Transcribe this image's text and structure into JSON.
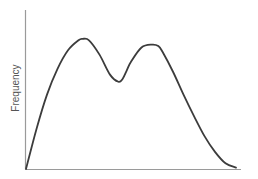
{
  "chart_data": {
    "type": "line",
    "title": "",
    "xlabel": "",
    "ylabel": "Frequency",
    "grid": false,
    "legend": "none",
    "x_ticks": [],
    "y_ticks": [],
    "xlim": [
      0,
      100
    ],
    "ylim": [
      0,
      100
    ],
    "series": [
      {
        "name": "distribution",
        "description": "bimodal distribution curve",
        "x": [
          0,
          5,
          10,
          15,
          20,
          25,
          27,
          30,
          35,
          40,
          44,
          46,
          48,
          50,
          55,
          60,
          63,
          65,
          70,
          75,
          80,
          85,
          90,
          95,
          100
        ],
        "y": [
          0,
          28,
          52,
          70,
          83,
          90,
          91,
          90,
          80,
          66,
          61,
          63,
          69,
          75,
          85,
          87,
          86,
          82,
          68,
          52,
          37,
          23,
          12,
          4,
          1
        ]
      }
    ],
    "annotations": []
  }
}
